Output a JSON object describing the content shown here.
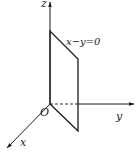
{
  "diagram": {
    "axes": {
      "x_label": "x",
      "y_label": "y",
      "z_label": "z",
      "origin_label": "O"
    },
    "plane_label": "x−y=0",
    "colors": {
      "stroke": "#1a1a1a",
      "background": "#ffffff"
    }
  }
}
